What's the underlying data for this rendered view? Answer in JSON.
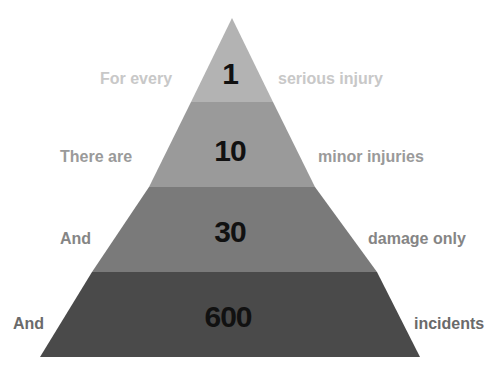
{
  "pyramid": {
    "levels": [
      {
        "left_text": "For every",
        "number": "1",
        "right_text": "serious injury",
        "fill": "#b3b3b3",
        "text_color": "#c8c8c8"
      },
      {
        "left_text": "There are",
        "number": "10",
        "right_text": "minor injuries",
        "fill": "#9a9a9a",
        "text_color": "#9a9a9a"
      },
      {
        "left_text": "And",
        "number": "30",
        "right_text": "damage only",
        "fill": "#7a7a7a",
        "text_color": "#858585"
      },
      {
        "left_text": "And",
        "number": "600",
        "right_text": "incidents",
        "fill": "#4a4a4a",
        "text_color": "#6a6a6a"
      }
    ]
  }
}
